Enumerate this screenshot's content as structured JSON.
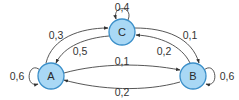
{
  "diagram": {
    "type": "state-transition",
    "colors": {
      "node_fill": "#a9d8f5",
      "node_stroke": "#3b8fc9",
      "edge": "#444444",
      "text": "#333333"
    },
    "nodes": [
      {
        "id": "A",
        "label": "A"
      },
      {
        "id": "B",
        "label": "B"
      },
      {
        "id": "C",
        "label": "C"
      }
    ],
    "edges": [
      {
        "from": "A",
        "to": "A",
        "label": "0,6"
      },
      {
        "from": "B",
        "to": "B",
        "label": "0,6"
      },
      {
        "from": "C",
        "to": "C",
        "label": "0,4"
      },
      {
        "from": "A",
        "to": "C",
        "label": "0,3"
      },
      {
        "from": "C",
        "to": "A",
        "label": "0,5"
      },
      {
        "from": "C",
        "to": "B",
        "label": "0,1"
      },
      {
        "from": "B",
        "to": "C",
        "label": "0,2"
      },
      {
        "from": "A",
        "to": "B",
        "label": "0,1"
      },
      {
        "from": "B",
        "to": "A",
        "label": "0,2"
      }
    ]
  }
}
